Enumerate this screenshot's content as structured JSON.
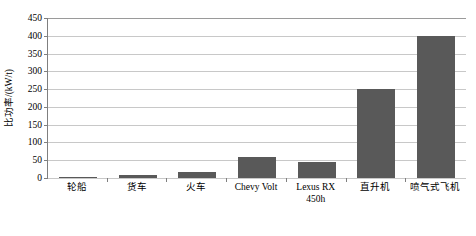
{
  "chart_data": {
    "type": "bar",
    "title": "",
    "xlabel": "",
    "ylabel": "比功率/(kW/t)",
    "ylim": [
      0,
      450
    ],
    "ytick_step": 50,
    "yticks": [
      "450",
      "400",
      "350",
      "300",
      "250",
      "200",
      "150",
      "100",
      "50",
      "0"
    ],
    "ytick_values": [
      450,
      400,
      350,
      300,
      250,
      200,
      150,
      100,
      50,
      0
    ],
    "grid": true,
    "legend": "none",
    "bar_color": "#595959",
    "gridline_color": "#c8c8c8",
    "axis_color": "#7f7f7f",
    "categories": [
      "轮船",
      "货车",
      "火车",
      "Chevy Volt",
      "Lexus RX 450h",
      "直升机",
      "喷气式飞机"
    ],
    "category_lines": [
      [
        "轮船"
      ],
      [
        "货车"
      ],
      [
        "火车"
      ],
      [
        "Chevy Volt"
      ],
      [
        "Lexus RX",
        "450h"
      ],
      [
        "直升机"
      ],
      [
        "喷气式飞机"
      ]
    ],
    "values": [
      1,
      8,
      18,
      60,
      45,
      250,
      400
    ]
  }
}
